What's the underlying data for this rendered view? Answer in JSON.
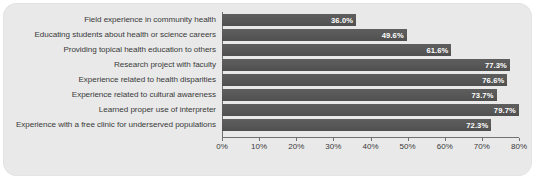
{
  "chart_data": {
    "type": "bar",
    "orientation": "horizontal",
    "title": "",
    "subtitle": "",
    "xlabel": "",
    "ylabel": "",
    "xlim": [
      0,
      80
    ],
    "grid": false,
    "legend": false,
    "legend_position": "none",
    "xtick_labels": [
      "0%",
      "10%",
      "20%",
      "30%",
      "40%",
      "50%",
      "60%",
      "70%",
      "80%"
    ],
    "xtick_values": [
      0,
      10,
      20,
      30,
      40,
      50,
      60,
      70,
      80
    ],
    "bar_color": "#585858",
    "value_label_color": "#ffffff",
    "background_color": "#e9e9e9",
    "axis_color": "#707070",
    "categories": [
      "Field experience in community health",
      "Educating students about health or science careers",
      "Providing topical health education to others",
      "Research project with faculty",
      "Experience related to health disparities",
      "Experience related to cultural awareness",
      "Learned proper use of interpreter",
      "Experience with a free clinic for underserved populations"
    ],
    "values": [
      36.0,
      49.6,
      61.6,
      77.3,
      76.6,
      73.7,
      79.7,
      72.3
    ],
    "value_labels": [
      "36.0%",
      "49.6%",
      "61.6%",
      "77.3%",
      "76.6%",
      "73.7%",
      "79.7%",
      "72.3%"
    ]
  }
}
